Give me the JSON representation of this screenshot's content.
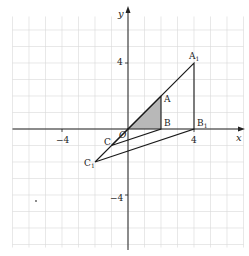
{
  "figure": {
    "type": "coordinate-plane-transformation",
    "axes": {
      "x_label": "x",
      "y_label": "y",
      "x_ticks": [
        {
          "value": -4,
          "label": "−4"
        },
        {
          "value": 4,
          "label": "4"
        }
      ],
      "y_ticks": [
        {
          "value": 4,
          "label": "4"
        },
        {
          "value": -4,
          "label": "−4"
        }
      ],
      "origin_label": "O"
    },
    "grid": {
      "x_range": [
        -7,
        7
      ],
      "y_range": [
        -7,
        7
      ],
      "step": 1,
      "color": "#d9d9d9"
    },
    "colors": {
      "axis": "#222222",
      "line": "#1a1a1a",
      "shade": "#b8b8b8"
    },
    "shaded_triangle": {
      "name": "OAB",
      "vertices": [
        {
          "label": "O",
          "x": 0,
          "y": 0
        },
        {
          "label": "A",
          "x": 2,
          "y": 2
        },
        {
          "label": "B",
          "x": 2,
          "y": 0
        }
      ]
    },
    "triangle_ABC": {
      "vertices": [
        {
          "label": "A",
          "x": 2,
          "y": 2
        },
        {
          "label": "B",
          "x": 2,
          "y": 0
        },
        {
          "label": "C",
          "x": -1,
          "y": -1
        }
      ]
    },
    "triangle_A1B1C1": {
      "vertices": [
        {
          "label": "A",
          "sub": "1",
          "x": 4,
          "y": 4
        },
        {
          "label": "B",
          "sub": "1",
          "x": 4,
          "y": 0
        },
        {
          "label": "C",
          "sub": "1",
          "x": -2,
          "y": -2
        }
      ]
    },
    "labels": {
      "A": "A",
      "B": "B",
      "C": "C",
      "A1": "A",
      "B1": "B",
      "C1": "C",
      "sub1": "1"
    }
  }
}
